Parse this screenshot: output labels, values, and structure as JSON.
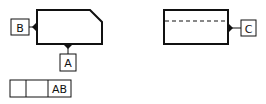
{
  "diagram": {
    "type": "geometric-tolerancing-datum-symbols",
    "stroke_color": "#111111",
    "background": "#ffffff",
    "datums": [
      {
        "id": "B",
        "label": "B",
        "attached_to": "left-part-left-edge"
      },
      {
        "id": "A",
        "label": "A",
        "attached_to": "left-part-bottom-edge"
      },
      {
        "id": "C",
        "label": "C",
        "attached_to": "right-part-right-edge"
      }
    ],
    "feature_control_frame": {
      "cells": [
        "",
        "",
        "AB"
      ]
    }
  }
}
